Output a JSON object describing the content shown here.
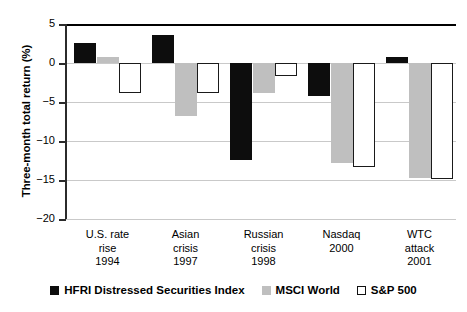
{
  "chart_data": {
    "type": "bar",
    "title": "",
    "xlabel": "",
    "ylabel": "Three-month total return (%)",
    "ylim": [
      -20,
      5
    ],
    "yticks": [
      5,
      0,
      -5,
      -10,
      -15,
      -20
    ],
    "ytick_labels": [
      "5",
      "0",
      "−5",
      "−10",
      "−15",
      "−20"
    ],
    "grid": true,
    "legend_position": "bottom",
    "categories": [
      "U.S. rate\nrise\n1994",
      "Asian\ncrisis\n1997",
      "Russian\ncrisis\n1998",
      "Nasdaq\n2000",
      "WTC\nattack\n2001"
    ],
    "category_lines": [
      [
        "U.S. rate",
        "rise",
        "1994"
      ],
      [
        "Asian",
        "crisis",
        "1997"
      ],
      [
        "Russian",
        "crisis",
        "1998"
      ],
      [
        "Nasdaq",
        "2000"
      ],
      [
        "WTC",
        "attack",
        "2001"
      ]
    ],
    "series": [
      {
        "name": "HFRI Distressed Securities Index",
        "key": "hfri",
        "color": "#0d0d0d",
        "values": [
          2.6,
          3.6,
          -12.4,
          -4.2,
          0.8
        ]
      },
      {
        "name": "MSCI World",
        "key": "msci",
        "color": "#bfbfbf",
        "values": [
          0.8,
          -6.8,
          -3.9,
          -12.8,
          -14.7
        ]
      },
      {
        "name": "S&P 500",
        "key": "snp",
        "color": "#ffffff",
        "values": [
          -3.8,
          -3.9,
          -1.7,
          -13.3,
          -14.9
        ]
      }
    ]
  },
  "axis": {
    "y_title": "Three-month total return (%)"
  },
  "legend": {
    "entries": [
      {
        "label": "HFRI Distressed Securities Index",
        "swatch": "hfri"
      },
      {
        "label": "MSCI World",
        "swatch": "msci"
      },
      {
        "label": "S&P 500",
        "swatch": "snp"
      }
    ]
  }
}
